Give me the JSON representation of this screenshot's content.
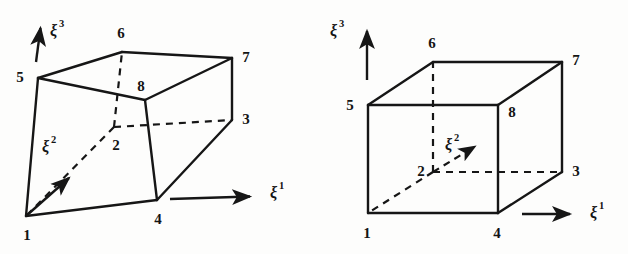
{
  "figure": {
    "background_color": "#fdfdfc",
    "ink_color": "#161616",
    "panels": [
      {
        "id": "left-panel",
        "name": "distorted-hexahedron",
        "description": "Distorted 8-node hexahedral element in physical space",
        "node_labels": [
          "1",
          "2",
          "3",
          "4",
          "5",
          "6",
          "7",
          "8"
        ],
        "nodes": [
          {
            "label": "1",
            "x": 26,
            "y": 216,
            "text_x": 27,
            "text_y": 240,
            "hidden": false
          },
          {
            "label": "2",
            "x": 114,
            "y": 127,
            "text_x": 116,
            "text_y": 150,
            "hidden": true
          },
          {
            "label": "3",
            "x": 232,
            "y": 120,
            "text_x": 246,
            "text_y": 124,
            "hidden": false
          },
          {
            "label": "4",
            "x": 157,
            "y": 200,
            "text_x": 158,
            "text_y": 224,
            "hidden": false
          },
          {
            "label": "5",
            "x": 38,
            "y": 78,
            "text_x": 20,
            "text_y": 82,
            "hidden": false
          },
          {
            "label": "6",
            "x": 122,
            "y": 52,
            "text_x": 121,
            "text_y": 38,
            "hidden": false
          },
          {
            "label": "7",
            "x": 232,
            "y": 58,
            "text_x": 246,
            "text_y": 62,
            "hidden": false
          },
          {
            "label": "8",
            "x": 145,
            "y": 100,
            "text_x": 141,
            "text_y": 91,
            "hidden": false
          }
        ],
        "axes": [
          {
            "name": "xi1",
            "base": "ξ",
            "superscript": "1",
            "label_x": 270,
            "label_y": 198,
            "from": [
              170,
              199
            ],
            "to": [
              254,
              196
            ],
            "dashed": false
          },
          {
            "name": "xi2",
            "base": "ξ",
            "superscript": "2",
            "label_x": 42,
            "label_y": 152,
            "from": [
              26,
              216
            ],
            "to": [
              72,
              176
            ],
            "dashed": false
          },
          {
            "name": "xi3",
            "base": "ξ",
            "superscript": "3",
            "label_x": 50,
            "label_y": 36,
            "from": [
              36,
              62
            ],
            "to": [
              41,
              25
            ],
            "dashed": false
          }
        ]
      },
      {
        "id": "right-panel",
        "name": "reference-cube",
        "description": "Regular reference cube element in natural coordinate space",
        "node_labels": [
          "1",
          "2",
          "3",
          "4",
          "5",
          "6",
          "7",
          "8"
        ],
        "nodes": [
          {
            "label": "1",
            "x": 368,
            "y": 213,
            "text_x": 367,
            "text_y": 238,
            "hidden": false
          },
          {
            "label": "2",
            "x": 433,
            "y": 172,
            "text_x": 421,
            "text_y": 174,
            "hidden": true
          },
          {
            "label": "3",
            "x": 562,
            "y": 172,
            "text_x": 576,
            "text_y": 176,
            "hidden": false
          },
          {
            "label": "4",
            "x": 498,
            "y": 213,
            "text_x": 497,
            "text_y": 238,
            "hidden": false
          },
          {
            "label": "5",
            "x": 368,
            "y": 105,
            "text_x": 350,
            "text_y": 110,
            "hidden": false
          },
          {
            "label": "6",
            "x": 433,
            "y": 62,
            "text_x": 432,
            "text_y": 48,
            "hidden": false
          },
          {
            "label": "7",
            "x": 562,
            "y": 62,
            "text_x": 576,
            "text_y": 65,
            "hidden": false
          },
          {
            "label": "8",
            "x": 498,
            "y": 105,
            "text_x": 512,
            "text_y": 117,
            "hidden": false
          }
        ],
        "axes": [
          {
            "name": "xi1",
            "base": "ξ",
            "superscript": "1",
            "label_x": 590,
            "label_y": 218,
            "from": [
              522,
              214
            ],
            "to": [
              574,
              214
            ],
            "dashed": false
          },
          {
            "name": "xi2",
            "base": "ξ",
            "superscript": "2",
            "label_x": 450,
            "label_y": 148,
            "from": [
              433,
              172
            ],
            "to": [
              478,
              144
            ],
            "dashed": true
          },
          {
            "name": "xi3",
            "base": "ξ",
            "superscript": "3",
            "label_x": 330,
            "label_y": 36,
            "from": [
              367,
              80
            ],
            "to": [
              367,
              28
            ],
            "dashed": false
          }
        ]
      }
    ]
  }
}
